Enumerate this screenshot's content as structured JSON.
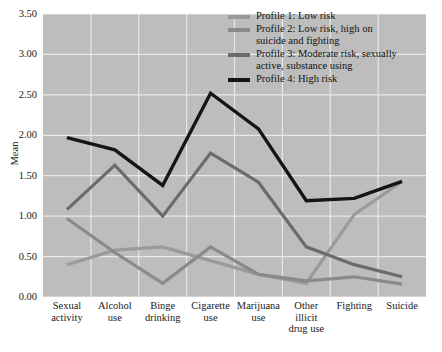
{
  "chart_data": {
    "type": "line",
    "title": "",
    "xlabel": "",
    "ylabel": "Mean",
    "ylim": [
      0.0,
      3.5
    ],
    "ytick_step": 0.5,
    "ytick_labels": [
      "0.00",
      "0.50",
      "1.00",
      "1.50",
      "2.00",
      "2.50",
      "3.00",
      "3.50"
    ],
    "grid": true,
    "legend_position": "top-right",
    "categories": [
      "Sexual\nactivity",
      "Alcohol\nuse",
      "Binge\ndrinking",
      "Cigarette\nuse",
      "Marijuana\nuse",
      "Other\nillicit\ndrug use",
      "Fighting",
      "Suicide"
    ],
    "series": [
      {
        "name": "Profile 1: Low risk",
        "color": "#9a9a9a",
        "values": [
          0.4,
          0.58,
          0.62,
          0.45,
          0.28,
          0.17,
          1.02,
          1.43
        ]
      },
      {
        "name": "Profile 2: Low risk, high on\nsuicide and fighting",
        "color": "#8a8a8a",
        "values": [
          0.97,
          0.55,
          0.17,
          0.62,
          0.28,
          0.2,
          0.25,
          0.16
        ]
      },
      {
        "name": "Profile 3: Moderate risk, sexually\nactive, substance using",
        "color": "#6b6b6b",
        "values": [
          1.08,
          1.63,
          1.0,
          1.78,
          1.42,
          0.62,
          0.4,
          0.25
        ]
      },
      {
        "name": "Profile 4: High risk",
        "color": "#151515",
        "values": [
          1.97,
          1.82,
          1.38,
          2.52,
          2.08,
          1.19,
          1.22,
          1.43
        ]
      }
    ]
  },
  "legend": {
    "items": [
      {
        "label": "Profile 1: Low risk",
        "color": "#9a9a9a"
      },
      {
        "label": "Profile 2: Low risk, high on\nsuicide and fighting",
        "color": "#8a8a8a"
      },
      {
        "label": "Profile 3: Moderate risk, sexually\nactive, substance using",
        "color": "#6b6b6b"
      },
      {
        "label": "Profile 4: High risk",
        "color": "#151515"
      }
    ]
  },
  "axes": {
    "y_title": "Mean"
  }
}
